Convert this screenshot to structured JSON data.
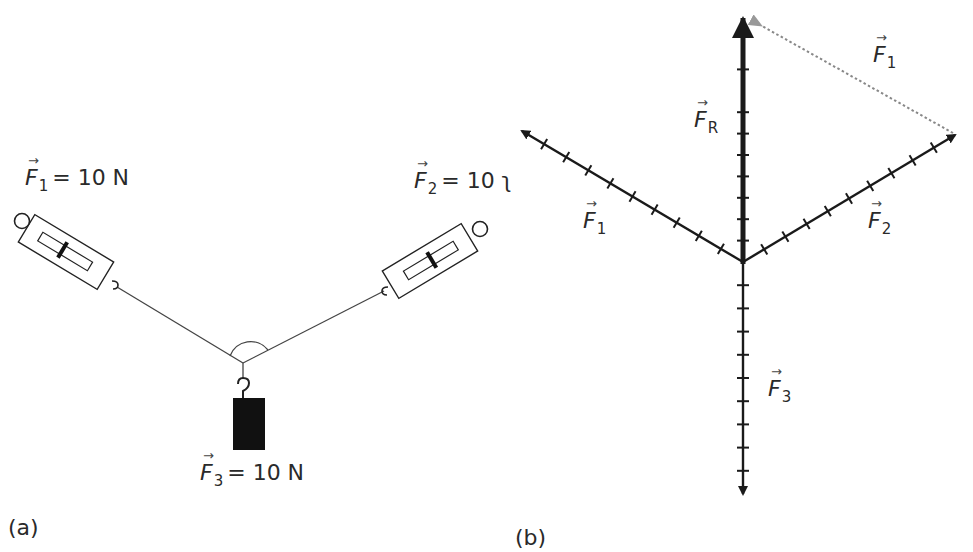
{
  "panel_a": {
    "caption": "(a)",
    "f1": {
      "symbol": "F",
      "sub": "1",
      "value": "= 10 N"
    },
    "f2": {
      "symbol": "F",
      "sub": "2",
      "value": "= 10 ʅ"
    },
    "f3": {
      "symbol": "F",
      "sub": "3",
      "value": "= 10 N"
    },
    "angle_marker": "arc between ropes"
  },
  "panel_b": {
    "caption": "(b)",
    "resultant": {
      "symbol": "F",
      "sub": "R"
    },
    "f1": {
      "symbol": "F",
      "sub": "1"
    },
    "f2": {
      "symbol": "F",
      "sub": "2"
    },
    "f3": {
      "symbol": "F",
      "sub": "3"
    },
    "f1_shifted": {
      "symbol": "F",
      "sub": "1"
    }
  },
  "colors": {
    "ink": "#1a1a1a",
    "rope": "#444444",
    "dotted": "#888888",
    "weight": "#111111"
  }
}
